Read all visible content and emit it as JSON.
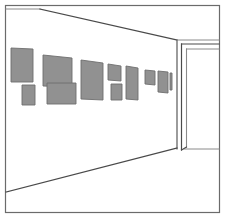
{
  "artwork": {
    "title": "Gallery Interior Perspective Sketch",
    "medium": "line drawing",
    "canvas": {
      "width": 225,
      "height": 218
    },
    "background_color": "#ffffff"
  },
  "palette": {
    "paper": "#ffffff",
    "ink": "#4a4a4a",
    "ink_light": "#8a8a8a",
    "painting_fill": "#919191",
    "painting_stroke": "#6e6e6e",
    "border_stroke": "#6b6b6b"
  },
  "border": {
    "label": "outer frame border",
    "x": 5.5,
    "y": 5.5,
    "width": 214,
    "height": 207,
    "stroke_width": 1.2
  },
  "room": {
    "label": "gallery room in one-point perspective",
    "ceiling_line": {
      "label": "ceiling edge receding to corner",
      "x1": 40,
      "y1": 9,
      "x2": 177,
      "y2": 40
    },
    "floor_line": {
      "label": "floor edge receding to corner",
      "x1": 6,
      "y1": 192,
      "x2": 177,
      "y2": 148
    },
    "corner_edge": {
      "label": "vertical room corner",
      "x1": 177,
      "y1": 40,
      "x2": 177,
      "y2": 149
    },
    "back_wall_top": {
      "label": "back wall top edge right of corner",
      "x1": 177,
      "y1": 40,
      "x2": 219,
      "y2": 40
    },
    "back_wall_bottom": {
      "label": "back wall base line right of corner",
      "x1": 184,
      "y1": 149,
      "x2": 219,
      "y2": 149
    },
    "left_wall_top_stub": {
      "label": "top wall stub at left",
      "x1": 6,
      "y1": 9,
      "x2": 40,
      "y2": 9
    }
  },
  "doorway": {
    "label": "open doorway on right wall",
    "outer_jamb": {
      "x1": 181.5,
      "y1": 44,
      "x2": 181.5,
      "y2": 150
    },
    "head_outer": {
      "x1": 181.5,
      "y1": 44,
      "x2": 219,
      "y2": 44
    },
    "inner_jamb": {
      "x1": 186.5,
      "y1": 49,
      "x2": 186.5,
      "y2": 147
    },
    "head_inner": {
      "x1": 186.5,
      "y1": 49,
      "x2": 219,
      "y2": 49
    },
    "sill": {
      "x1": 181.5,
      "y1": 150,
      "x2": 186.5,
      "y2": 147
    }
  },
  "paintings": {
    "label": "row of framed artworks hung on the left wall",
    "count": 11,
    "items": [
      {
        "id": "painting-1",
        "name": "large upper left canvas",
        "points": "11,48 33,49 33,82 11,82"
      },
      {
        "id": "painting-2",
        "name": "wide upper canvas",
        "points": "43,55 72,58 72,87 43,86"
      },
      {
        "id": "painting-3",
        "name": "small lower left square",
        "points": "22,85 35,85 35,105 22,105"
      },
      {
        "id": "painting-4",
        "name": "wide lower canvas",
        "points": "47,83 76,83 76,104 47,104"
      },
      {
        "id": "painting-5",
        "name": "tall middle canvas",
        "points": "81,60 103,63 103,100 81,99"
      },
      {
        "id": "painting-6",
        "name": "upper small canvas",
        "points": "108,64 121,66 121,81 108,80"
      },
      {
        "id": "painting-7",
        "name": "lower small canvas",
        "points": "111,84 122,84 122,100 111,100"
      },
      {
        "id": "painting-8",
        "name": "tall narrow canvas",
        "points": "126,66 138,68 138,100 126,99"
      },
      {
        "id": "painting-9",
        "name": "far small canvas",
        "points": "145,70 155,71 155,85 145,84"
      },
      {
        "id": "painting-10",
        "name": "farthest narrow canvas",
        "points": "158,71 168,72 168,93 158,92"
      },
      {
        "id": "painting-11",
        "name": "back small canvas near corner",
        "points": "170,73 172,73 172,90 170,90"
      }
    ]
  }
}
